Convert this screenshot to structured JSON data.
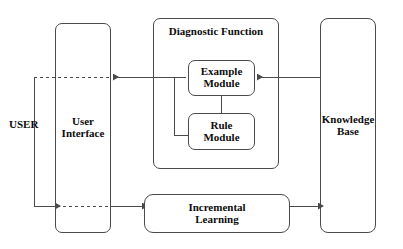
{
  "diagram": {
    "background_color": "#ffffff",
    "line_color": "#4a4a4a",
    "text_color": "#0d0d0d",
    "nodes": {
      "user": {
        "label": "USER"
      },
      "user_interface": {
        "line1": "User",
        "line2": "Interface"
      },
      "diagnostic_function": {
        "label": "Diagnostic Function"
      },
      "example_module": {
        "line1": "Example",
        "line2": "Module"
      },
      "rule_module": {
        "line1": "Rule",
        "line2": "Module"
      },
      "incremental_learning": {
        "line1": "Incremental",
        "line2": "Learning"
      },
      "knowledge_base": {
        "line1": "Knowledge",
        "line2": "Base"
      }
    },
    "connections": [
      {
        "name": "knowledge-base-to-example-module",
        "style": "solid",
        "arrow": "left"
      },
      {
        "name": "example-module-to-user-interface",
        "style": "solid",
        "arrow": "left"
      },
      {
        "name": "example-module-to-rule-module",
        "style": "solid",
        "arrow": "none"
      },
      {
        "name": "rule-module-to-output-line",
        "style": "solid",
        "arrow": "none"
      },
      {
        "name": "user-interface-internal-top",
        "style": "dashed",
        "arrow": "none"
      },
      {
        "name": "user-feedback-loop",
        "style": "solid",
        "arrow": "right"
      },
      {
        "name": "user-interface-internal-bottom",
        "style": "dashed",
        "arrow": "none"
      },
      {
        "name": "user-interface-to-incremental-learning",
        "style": "solid",
        "arrow": "right"
      },
      {
        "name": "incremental-learning-to-knowledge-base",
        "style": "solid",
        "arrow": "right"
      }
    ]
  }
}
